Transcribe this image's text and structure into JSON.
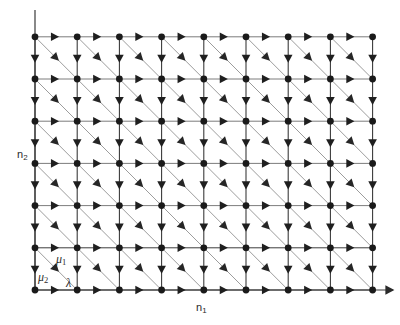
{
  "figure": {
    "type": "lattice-transition-diagram"
  },
  "axes": {
    "x": {
      "label": "n",
      "sub": "1",
      "name": "n1",
      "origin_px": 35,
      "end_px": 393,
      "baseline_px": 290,
      "arrow": true
    },
    "y": {
      "label": "n",
      "sub": "2",
      "name": "n2",
      "origin_px": 290,
      "end_px": 10,
      "baseline_px": 35,
      "arrow": false
    }
  },
  "lattice": {
    "columns": 9,
    "rows": 7,
    "x0": 35,
    "y0": 290,
    "dx": 42.2,
    "dy": 42.2,
    "node_radius": 3.4,
    "node_color": "#1a1a1a",
    "edge_color": "#5a5a5a",
    "strong_edge_color": "#333333",
    "diagonal_color": "#8a8a8a",
    "background": "#ffffff"
  },
  "edge_labels": [
    {
      "id": "mu1",
      "text": "μ",
      "sub": "1",
      "edge": "diagonal"
    },
    {
      "id": "mu2",
      "text": "μ",
      "sub": "2",
      "edge": "vertical-down"
    },
    {
      "id": "lambda",
      "text": "λ",
      "sub": "",
      "edge": "horizontal-right"
    }
  ],
  "arrows": {
    "horizontal": {
      "direction": "right",
      "label_ref": "lambda"
    },
    "vertical": {
      "direction": "down",
      "label_ref": "mu2"
    },
    "diagonal": {
      "direction": "down-right",
      "label_ref": "mu1"
    }
  },
  "chart_data": {
    "type": "scatter",
    "title": "",
    "xlabel": "n1",
    "ylabel": "n2",
    "grid": true,
    "legend": "none",
    "xlim": [
      0,
      8
    ],
    "ylim": [
      0,
      6
    ],
    "categories": [
      "0",
      "1",
      "2",
      "3",
      "4",
      "5",
      "6",
      "7",
      "8"
    ],
    "series": [
      {
        "name": "lattice nodes row 0",
        "x": [
          0,
          1,
          2,
          3,
          4,
          5,
          6,
          7,
          8
        ],
        "values": [
          0,
          0,
          0,
          0,
          0,
          0,
          0,
          0,
          0
        ]
      },
      {
        "name": "lattice nodes row 1",
        "x": [
          0,
          1,
          2,
          3,
          4,
          5,
          6,
          7,
          8
        ],
        "values": [
          1,
          1,
          1,
          1,
          1,
          1,
          1,
          1,
          1
        ]
      },
      {
        "name": "lattice nodes row 2",
        "x": [
          0,
          1,
          2,
          3,
          4,
          5,
          6,
          7,
          8
        ],
        "values": [
          2,
          2,
          2,
          2,
          2,
          2,
          2,
          2,
          2
        ]
      },
      {
        "name": "lattice nodes row 3",
        "x": [
          0,
          1,
          2,
          3,
          4,
          5,
          6,
          7,
          8
        ],
        "values": [
          3,
          3,
          3,
          3,
          3,
          3,
          3,
          3,
          3
        ]
      },
      {
        "name": "lattice nodes row 4",
        "x": [
          0,
          1,
          2,
          3,
          4,
          5,
          6,
          7,
          8
        ],
        "values": [
          4,
          4,
          4,
          4,
          4,
          4,
          4,
          4,
          4
        ]
      },
      {
        "name": "lattice nodes row 5",
        "x": [
          0,
          1,
          2,
          3,
          4,
          5,
          6,
          7,
          8
        ],
        "values": [
          5,
          5,
          5,
          5,
          5,
          5,
          5,
          5,
          5
        ]
      },
      {
        "name": "lattice nodes row 6",
        "x": [
          0,
          1,
          2,
          3,
          4,
          5,
          6,
          7,
          8
        ],
        "values": [
          6,
          6,
          6,
          6,
          6,
          6,
          6,
          6,
          6
        ]
      }
    ],
    "annotations": [
      {
        "text": "μ1",
        "x": 0.5,
        "y": 0.62,
        "note": "diagonal down-right transition rate"
      },
      {
        "text": "μ2",
        "x": 0.06,
        "y": 0.5,
        "note": "vertical down transition rate"
      },
      {
        "text": "λ",
        "x": 0.5,
        "y": 0.06,
        "note": "horizontal right transition rate"
      }
    ]
  }
}
